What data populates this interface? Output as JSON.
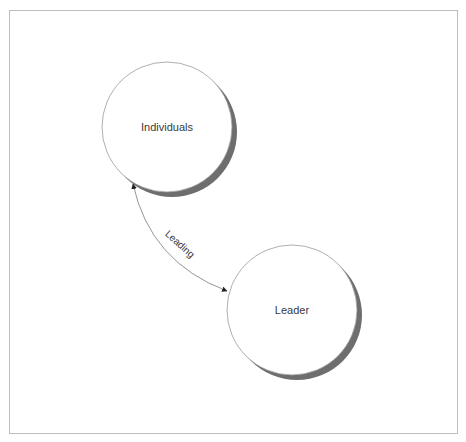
{
  "diagram": {
    "nodes": [
      {
        "id": "individuals",
        "label": "Individuals",
        "cx": 167,
        "cy": 127,
        "r": 65
      },
      {
        "id": "leader",
        "label": "Leader",
        "cx": 292,
        "cy": 310,
        "r": 65
      }
    ],
    "edges": [
      {
        "from": "individuals",
        "to": "leader",
        "label": "Leading",
        "direction": "bidirectional"
      }
    ],
    "colors": {
      "frame": "#bdbdbd",
      "circle_stroke": "#9a9a9a",
      "shadow": "#6e6e6e",
      "text": "#3a3a3a",
      "edge": "#7a7a7a"
    }
  }
}
